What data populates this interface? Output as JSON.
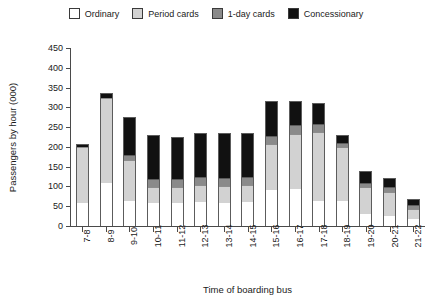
{
  "chart_data": {
    "type": "bar",
    "stacked": true,
    "title": "",
    "xlabel": "Time of boarding bus",
    "ylabel": "Passengers by hour (000)",
    "ylim": [
      0,
      450
    ],
    "yticks": [
      0,
      50,
      100,
      150,
      200,
      250,
      300,
      350,
      400,
      450
    ],
    "grid": false,
    "legend_position": "top-center",
    "categories": [
      "7-8",
      "8-9",
      "9-10",
      "10-11",
      "11-12",
      "12-13",
      "13-14",
      "14-15",
      "15-16",
      "16-17",
      "17-18",
      "18-19",
      "19-20",
      "20-21",
      "21-22"
    ],
    "series": [
      {
        "name": "Ordinary",
        "color": "#ffffff",
        "values": [
          58,
          110,
          63,
          60,
          58,
          62,
          60,
          62,
          93,
          95,
          65,
          63,
          30,
          25,
          18
        ]
      },
      {
        "name": "Period cards",
        "color": "#d2d2d2",
        "values": [
          145,
          215,
          105,
          41,
          42,
          44,
          42,
          44,
          115,
          140,
          175,
          140,
          70,
          63,
          28
        ]
      },
      {
        "name": "1-day cards",
        "color": "#8a8a8a",
        "values": [
          0,
          0,
          13,
          20,
          20,
          20,
          21,
          20,
          22,
          22,
          20,
          10,
          12,
          12,
          8
        ]
      },
      {
        "name": "Concessionary",
        "color": "#111111",
        "values": [
          4,
          12,
          95,
          110,
          104,
          110,
          112,
          110,
          85,
          58,
          52,
          18,
          28,
          22,
          14
        ]
      }
    ],
    "totals": [
      207,
      337,
      276,
      231,
      224,
      236,
      235,
      236,
      315,
      315,
      312,
      231,
      140,
      122,
      68
    ]
  },
  "legend": {
    "entries": [
      {
        "label": "Ordinary",
        "color": "#ffffff"
      },
      {
        "label": "Period cards",
        "color": "#d2d2d2"
      },
      {
        "label": "1-day cards",
        "color": "#8a8a8a"
      },
      {
        "label": "Concessionary",
        "color": "#111111"
      }
    ]
  }
}
